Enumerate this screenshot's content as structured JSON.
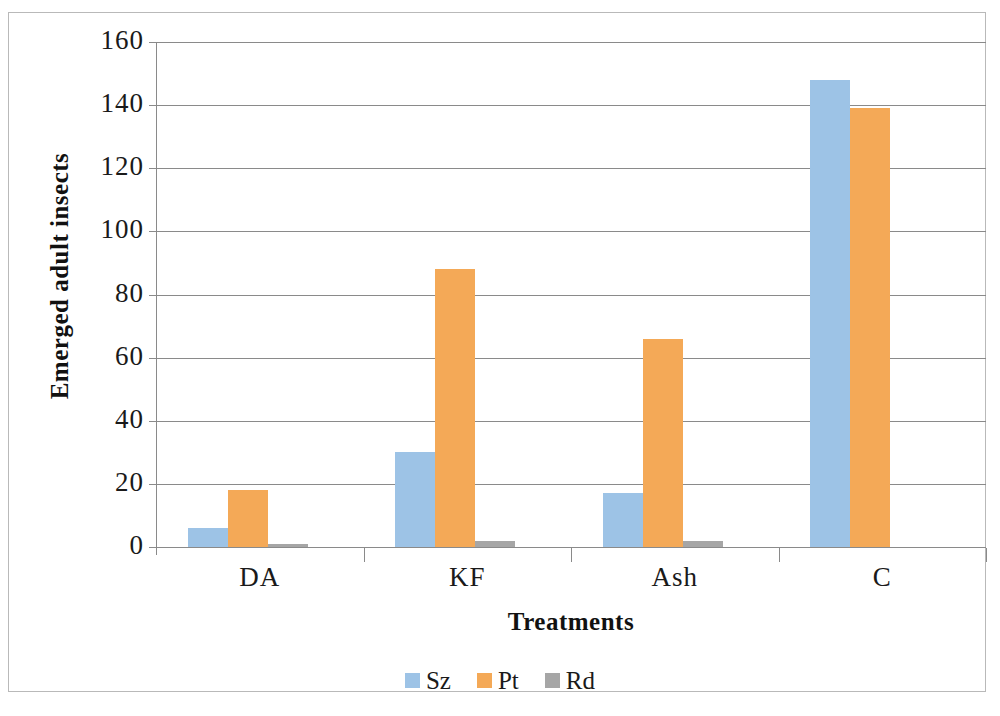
{
  "chart_data": {
    "type": "bar",
    "title": "",
    "xlabel": "Treatments",
    "ylabel": "Emerged adult insects",
    "categories": [
      "DA",
      "KF",
      "Ash",
      "C"
    ],
    "series": [
      {
        "name": "Sz",
        "color": "#9DC3E6",
        "values": [
          6,
          30,
          17,
          148
        ]
      },
      {
        "name": "Pt",
        "color": "#F4A957",
        "values": [
          18,
          88,
          66,
          139
        ]
      },
      {
        "name": "Rd",
        "color": "#A6A6A6",
        "values": [
          1,
          2,
          2,
          0
        ]
      }
    ],
    "ylim": [
      0,
      160
    ],
    "ytick_step": 20,
    "yticks": [
      160,
      140,
      120,
      100,
      80,
      60,
      40,
      20,
      0
    ],
    "grid": true,
    "legend_position": "bottom",
    "axis_color": "#8A8A8A",
    "frame_color": "#B9B9B9"
  }
}
